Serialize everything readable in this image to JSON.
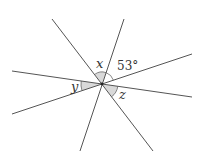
{
  "diagram": {
    "type": "intersecting-lines-angles",
    "colors": {
      "line": "#555555",
      "fill": "#d9d9d9",
      "text": "#333333"
    },
    "center": [
      102,
      84
    ],
    "lines": [
      {
        "from": [
          52,
          19
        ],
        "to": [
          153,
          151
        ]
      },
      {
        "from": [
          124,
          19
        ],
        "to": [
          80,
          151
        ]
      },
      {
        "from": [
          12,
          71
        ],
        "to": [
          192,
          97
        ]
      },
      {
        "from": [
          12,
          114
        ],
        "to": [
          192,
          54
        ]
      }
    ],
    "labels": {
      "x": "x",
      "y": "y",
      "z": "z",
      "angle_value": "53°"
    }
  }
}
